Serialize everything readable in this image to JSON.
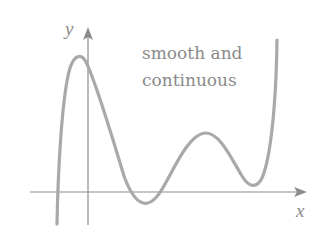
{
  "figure": {
    "annotation_line1": "smooth and",
    "annotation_line2": "continuous",
    "x_axis_label": "x",
    "y_axis_label": "y",
    "colors": {
      "curve": "#a9a9a9",
      "axes": "#8c8c8c",
      "text": "#8a8a8a",
      "background": "#ffffff"
    }
  }
}
